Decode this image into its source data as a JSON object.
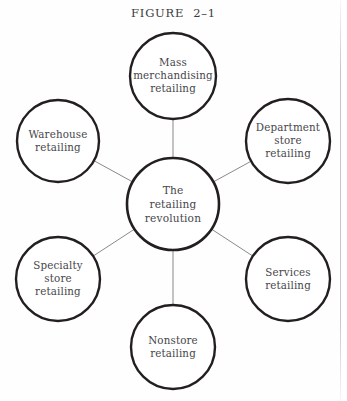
{
  "figure": {
    "title": "FIGURE  2–1",
    "background_color": "#fefefe",
    "circle_stroke_color": "#231f20",
    "connector_stroke_color": "#7c7c81",
    "text_color": "#46464a"
  },
  "diagram": {
    "type": "hub-and-spoke",
    "center": {
      "id": "retailing-revolution",
      "label": "The\nretailing\nrevolution",
      "cx": 173,
      "cy": 204,
      "r": 46,
      "stroke_width": 2.6
    },
    "nodes": [
      {
        "id": "mass-merchandising-retailing",
        "label": "Mass\nmerchandising\nretailing",
        "cx": 173,
        "cy": 76,
        "r": 43,
        "stroke_width": 2.4,
        "position": "top"
      },
      {
        "id": "department-store-retailing",
        "label": "Department\nstore\nretailing",
        "cx": 288,
        "cy": 141,
        "r": 42,
        "stroke_width": 2.4,
        "position": "upper-right"
      },
      {
        "id": "services-retailing",
        "label": "Services\nretailing",
        "cx": 288,
        "cy": 279,
        "r": 42,
        "stroke_width": 2.4,
        "position": "lower-right"
      },
      {
        "id": "nonstore-retailing",
        "label": "Nonstore\nretailing",
        "cx": 173,
        "cy": 347,
        "r": 42,
        "stroke_width": 2.4,
        "position": "bottom"
      },
      {
        "id": "specialty-store-retailing",
        "label": "Specialty\nstore\nretailing",
        "cx": 58,
        "cy": 279,
        "r": 42,
        "stroke_width": 2.4,
        "position": "lower-left"
      },
      {
        "id": "warehouse-retailing",
        "label": "Warehouse\nretailing",
        "cx": 58,
        "cy": 141,
        "r": 41,
        "stroke_width": 2.4,
        "position": "upper-left"
      }
    ],
    "connectors": [
      {
        "id": "connector-top",
        "from": "retailing-revolution",
        "to": "mass-merchandising-retailing"
      },
      {
        "id": "connector-upper-right",
        "from": "retailing-revolution",
        "to": "department-store-retailing"
      },
      {
        "id": "connector-lower-right",
        "from": "retailing-revolution",
        "to": "services-retailing"
      },
      {
        "id": "connector-bottom",
        "from": "retailing-revolution",
        "to": "nonstore-retailing"
      },
      {
        "id": "connector-lower-left",
        "from": "retailing-revolution",
        "to": "specialty-store-retailing"
      },
      {
        "id": "connector-upper-left",
        "from": "retailing-revolution",
        "to": "warehouse-retailing"
      }
    ]
  },
  "page_edge": {
    "x": 340,
    "visible": true
  }
}
